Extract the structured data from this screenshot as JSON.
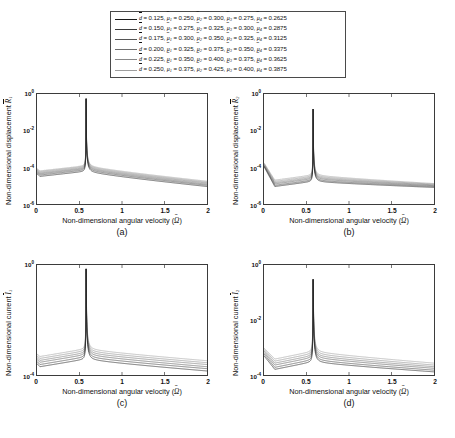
{
  "legend": {
    "title": "",
    "rows": [
      {
        "omega": "0.125",
        "mu1": "0.250",
        "mu2": "0.300",
        "mu3": "0.275",
        "mu4": "0.2625",
        "color": "#1a1a1a"
      },
      {
        "omega": "0.150",
        "mu1": "0.275",
        "mu2": "0.325",
        "mu3": "0.300",
        "mu4": "0.2875",
        "color": "#3a3a3a"
      },
      {
        "omega": "0.175",
        "mu1": "0.300",
        "mu2": "0.350",
        "mu3": "0.325",
        "mu4": "0.3125",
        "color": "#555555"
      },
      {
        "omega": "0.200",
        "mu1": "0.325",
        "mu2": "0.375",
        "mu3": "0.350",
        "mu4": "0.3375",
        "color": "#6e6e6e"
      },
      {
        "omega": "0.225",
        "mu1": "0.350",
        "mu2": "0.400",
        "mu3": "0.375",
        "mu4": "0.3625",
        "color": "#878787"
      },
      {
        "omega": "0.250",
        "mu1": "0.375",
        "mu2": "0.425",
        "mu3": "0.400",
        "mu4": "0.3875",
        "color": "#9e9e9e"
      }
    ],
    "symbols": {
      "omega_sym": "d",
      "mu_sym": "μ",
      "equals": "="
    }
  },
  "chart_data": [
    {
      "id": "a",
      "type": "line",
      "caption": "(a)",
      "title": "",
      "xlabel": "Non-dimensional angular velocity",
      "xlabel_symbol": "Ω",
      "ylabel": "Non-dimensional displacement",
      "ylabel_symbol": "R",
      "ylabel_sub": "1",
      "xlim": [
        0,
        2
      ],
      "ylim": [
        1e-06,
        1
      ],
      "yscale": "log",
      "xticks": [
        "0",
        "0.5",
        "1",
        "1.5",
        "2"
      ],
      "yticks": [
        "10",
        "10",
        "10",
        "10"
      ],
      "ytick_exponents": [
        "0",
        "-2",
        "-4",
        "-6"
      ],
      "grid": false,
      "legend_position": "top-shared",
      "resonance_x": 0.578,
      "peak_y": 0.55,
      "series": [
        {
          "name": "0.125",
          "left_edge_y": 4.5e-05,
          "trough_y": 3.2e-05,
          "right_end_y": 9e-06,
          "color": "#1a1a1a"
        },
        {
          "name": "0.150",
          "left_edge_y": 5.2e-05,
          "trough_y": 3.8e-05,
          "right_end_y": 1.05e-05,
          "color": "#3a3a3a"
        },
        {
          "name": "0.175",
          "left_edge_y": 6e-05,
          "trough_y": 4.4e-05,
          "right_end_y": 1.2e-05,
          "color": "#555555"
        },
        {
          "name": "0.200",
          "left_edge_y": 6.8e-05,
          "trough_y": 5e-05,
          "right_end_y": 1.38e-05,
          "color": "#6e6e6e"
        },
        {
          "name": "0.225",
          "left_edge_y": 7.6e-05,
          "trough_y": 5.7e-05,
          "right_end_y": 1.55e-05,
          "color": "#878787"
        },
        {
          "name": "0.250",
          "left_edge_y": 8.5e-05,
          "trough_y": 6.4e-05,
          "right_end_y": 1.75e-05,
          "color": "#9e9e9e"
        }
      ]
    },
    {
      "id": "b",
      "type": "line",
      "caption": "(b)",
      "title": "",
      "xlabel": "Non-dimensional angular velocity",
      "xlabel_symbol": "Ω",
      "ylabel": "Non-dimensional displacement",
      "ylabel_symbol": "R",
      "ylabel_sub": "2",
      "xlim": [
        0,
        2
      ],
      "ylim": [
        1e-06,
        1
      ],
      "yscale": "log",
      "xticks": [
        "0",
        "0.5",
        "1",
        "1.5",
        "2"
      ],
      "yticks": [
        "10",
        "10",
        "10",
        "10"
      ],
      "ytick_exponents": [
        "0",
        "-2",
        "-4",
        "-6"
      ],
      "grid": false,
      "legend_position": "top-shared",
      "resonance_x": 0.578,
      "peak_y": 0.15,
      "series": [
        {
          "name": "0.125",
          "left_edge_y": 0.00011,
          "trough_y": 9e-06,
          "right_end_y": 8e-06,
          "color": "#1a1a1a"
        },
        {
          "name": "0.150",
          "left_edge_y": 0.00012,
          "trough_y": 1.05e-05,
          "right_end_y": 9e-06,
          "color": "#3a3a3a"
        },
        {
          "name": "0.175",
          "left_edge_y": 0.00013,
          "trough_y": 1.25e-05,
          "right_end_y": 1e-05,
          "color": "#555555"
        },
        {
          "name": "0.200",
          "left_edge_y": 0.000145,
          "trough_y": 1.45e-05,
          "right_end_y": 1.1e-05,
          "color": "#6e6e6e"
        },
        {
          "name": "0.225",
          "left_edge_y": 0.00016,
          "trough_y": 1.7e-05,
          "right_end_y": 1.2e-05,
          "color": "#878787"
        },
        {
          "name": "0.250",
          "left_edge_y": 0.000175,
          "trough_y": 2e-05,
          "right_end_y": 1.3e-05,
          "color": "#9e9e9e"
        }
      ]
    },
    {
      "id": "c",
      "type": "line",
      "caption": "(c)",
      "title": "",
      "xlabel": "Non-dimensional angular velocity",
      "xlabel_symbol": "Ω",
      "ylabel": "Non-dimensional current",
      "ylabel_symbol": "I",
      "ylabel_sub": "1",
      "xlim": [
        0,
        2
      ],
      "ylim": [
        0.0001,
        1
      ],
      "yscale": "log",
      "xticks": [
        "0",
        "0.5",
        "1",
        "1.5",
        "2"
      ],
      "yticks": [
        "10",
        "10"
      ],
      "ytick_exponents": [
        "0",
        "-4"
      ],
      "grid": false,
      "legend_position": "top-shared",
      "resonance_x": 0.578,
      "peak_y": 0.72,
      "series": [
        {
          "name": "0.125",
          "left_edge_y": 0.00026,
          "trough_y": 0.0002,
          "right_end_y": 0.00014,
          "color": "#1a1a1a"
        },
        {
          "name": "0.150",
          "left_edge_y": 0.00031,
          "trough_y": 0.00024,
          "right_end_y": 0.00017,
          "color": "#3a3a3a"
        },
        {
          "name": "0.175",
          "left_edge_y": 0.00037,
          "trough_y": 0.00029,
          "right_end_y": 0.0002,
          "color": "#555555"
        },
        {
          "name": "0.200",
          "left_edge_y": 0.00043,
          "trough_y": 0.00034,
          "right_end_y": 0.00024,
          "color": "#6e6e6e"
        },
        {
          "name": "0.225",
          "left_edge_y": 0.0005,
          "trough_y": 0.0004,
          "right_end_y": 0.00028,
          "color": "#878787"
        },
        {
          "name": "0.250",
          "left_edge_y": 0.00058,
          "trough_y": 0.00047,
          "right_end_y": 0.00033,
          "color": "#9e9e9e"
        }
      ]
    },
    {
      "id": "d",
      "type": "line",
      "caption": "(d)",
      "title": "",
      "xlabel": "Non-dimensional angular velocity",
      "xlabel_symbol": "Ω",
      "ylabel": "Non-dimensional current",
      "ylabel_symbol": "I",
      "ylabel_sub": "2",
      "xlim": [
        0,
        2
      ],
      "ylim": [
        0.0001,
        1
      ],
      "yscale": "log",
      "xticks": [
        "0",
        "0.5",
        "1",
        "1.5",
        "2"
      ],
      "yticks": [
        "10",
        "10",
        "10"
      ],
      "ytick_exponents": [
        "0",
        "-2",
        "-4"
      ],
      "grid": false,
      "legend_position": "top-shared",
      "resonance_x": 0.578,
      "peak_y": 0.3,
      "series": [
        {
          "name": "0.125",
          "left_edge_y": 0.0005,
          "trough_y": 0.00016,
          "right_end_y": 0.00013,
          "color": "#1a1a1a"
        },
        {
          "name": "0.150",
          "left_edge_y": 0.00058,
          "trough_y": 0.00019,
          "right_end_y": 0.00015,
          "color": "#3a3a3a"
        },
        {
          "name": "0.175",
          "left_edge_y": 0.00066,
          "trough_y": 0.00023,
          "right_end_y": 0.000175,
          "color": "#555555"
        },
        {
          "name": "0.200",
          "left_edge_y": 0.00075,
          "trough_y": 0.00027,
          "right_end_y": 0.0002,
          "color": "#6e6e6e"
        },
        {
          "name": "0.225",
          "left_edge_y": 0.00085,
          "trough_y": 0.00032,
          "right_end_y": 0.00023,
          "color": "#878787"
        },
        {
          "name": "0.250",
          "left_edge_y": 0.00095,
          "trough_y": 0.00038,
          "right_end_y": 0.00027,
          "color": "#9e9e9e"
        }
      ]
    }
  ]
}
